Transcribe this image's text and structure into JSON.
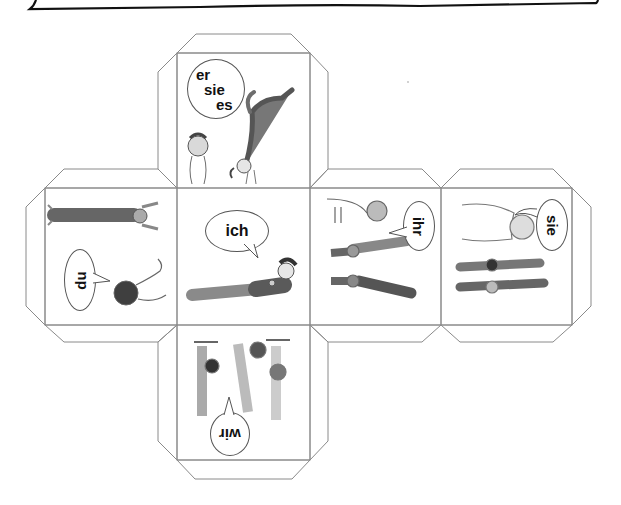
{
  "worksheet": {
    "header_box": "hand-drawn-frame-bottom-edge",
    "net_type": "cube-net-with-glue-flaps"
  },
  "faces": [
    {
      "id": "top",
      "pronoun_lines": [
        "er",
        "sie",
        "es"
      ],
      "illustration": "child-standing-and-child-doing-handstand",
      "rotation_deg": 0
    },
    {
      "id": "left",
      "pronoun": "du",
      "illustration": "child-pointing-and-child-lying",
      "rotation_deg": -90
    },
    {
      "id": "center",
      "pronoun": "ich",
      "illustration": "child-lying-on-floor",
      "rotation_deg": 0
    },
    {
      "id": "right1",
      "pronoun": "ihr",
      "illustration": "adult-pointing-at-two-children-exercising",
      "rotation_deg": 90
    },
    {
      "id": "right2",
      "pronoun": "sie",
      "illustration": "adult-watching-two-children-lying",
      "rotation_deg": 90
    },
    {
      "id": "bottom",
      "pronoun": "wir",
      "illustration": "three-children-hanging-on-bar",
      "rotation_deg": 180
    }
  ],
  "colors": {
    "line": "#8a8a8a",
    "ink": "#111111",
    "sketch": "#6d6d6d",
    "shade": "#5a5a5a"
  }
}
